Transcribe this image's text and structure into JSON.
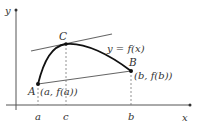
{
  "diagram": {
    "axes": {
      "x_label": "x",
      "y_label": "y"
    },
    "curve_label": "y = f(x)",
    "points": [
      {
        "id": "A",
        "label": "A",
        "coord_label": "(a, f(a))"
      },
      {
        "id": "B",
        "label": "B",
        "coord_label": "(b, f(b))"
      },
      {
        "id": "C",
        "label": "C"
      }
    ],
    "x_ticks": [
      {
        "label": "a"
      },
      {
        "label": "c"
      },
      {
        "label": "b"
      }
    ],
    "lines": {
      "secant": "A to B",
      "tangent": "tangent at C parallel to secant"
    },
    "colors": {
      "axis": "#555555",
      "curve": "#111111",
      "lines": "#666666",
      "dashed": "#777777",
      "text": "#333333"
    }
  }
}
